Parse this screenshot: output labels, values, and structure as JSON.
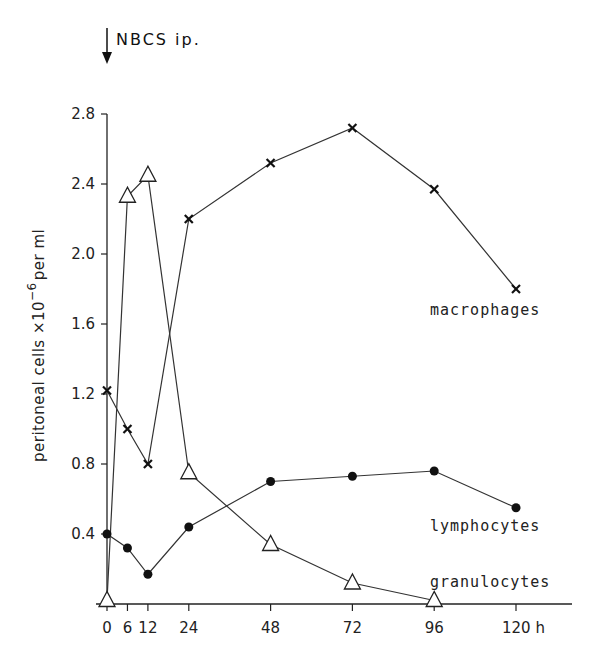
{
  "chart_data": {
    "type": "line",
    "title": "",
    "annotation": "NBCS ip.",
    "annotation_x": 0,
    "xlabel": "h",
    "ylabel": "peritoneal cells ×10^-6 per ml",
    "ylabel_main": "peritoneal cells ×10",
    "ylabel_exp": "−6",
    "ylabel_tail": "per ml",
    "x_ticks": [
      0,
      6,
      12,
      24,
      48,
      72,
      96,
      120
    ],
    "x_tick_labels": [
      "0",
      "6",
      "12",
      "24",
      "48",
      "72",
      "96",
      "120 h"
    ],
    "y_ticks": [
      0.4,
      0.8,
      1.2,
      1.6,
      2.0,
      2.4,
      2.8
    ],
    "y_tick_labels": [
      "0.4",
      "0.8",
      "1.2",
      "1.6",
      "2.0",
      "2.4",
      "2.8"
    ],
    "xlim": [
      0,
      136
    ],
    "ylim": [
      0,
      2.8
    ],
    "grid": false,
    "legend": "inline labels next to series",
    "series": [
      {
        "name": "macrophages",
        "marker": "x",
        "x": [
          0,
          6,
          12,
          24,
          48,
          72,
          96,
          120
        ],
        "values": [
          1.22,
          1.0,
          0.8,
          2.2,
          2.52,
          2.72,
          2.37,
          1.8
        ]
      },
      {
        "name": "lymphocytes",
        "marker": "filled-circle",
        "x": [
          0,
          6,
          12,
          24,
          48,
          72,
          96,
          120
        ],
        "values": [
          0.4,
          0.32,
          0.17,
          0.44,
          0.7,
          0.73,
          0.76,
          0.55
        ]
      },
      {
        "name": "granulocytes",
        "marker": "open-triangle",
        "x": [
          0,
          6,
          12,
          24,
          48,
          72,
          96
        ],
        "values": [
          0.02,
          2.33,
          2.45,
          0.75,
          0.34,
          0.12,
          0.02
        ]
      }
    ]
  },
  "labels": {
    "annotation": "NBCS ip.",
    "macrophages": "macrophages",
    "lymphocytes": "lymphocytes",
    "granulocytes": "granulocytes"
  }
}
